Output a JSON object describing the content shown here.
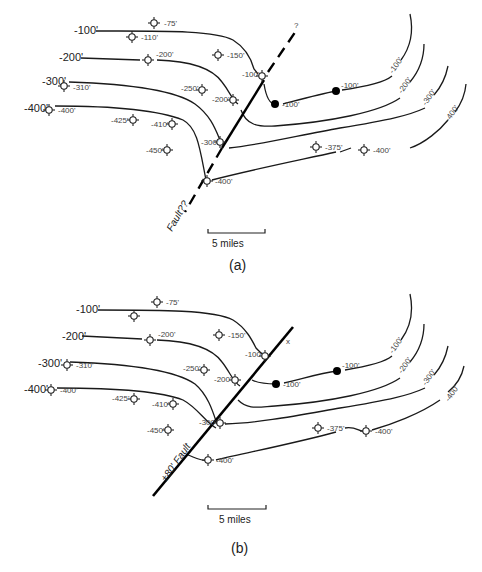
{
  "figure": {
    "panels": [
      {
        "id": "a",
        "caption": "(a)",
        "fault_label": "Fault??",
        "fault_end_marker": "?",
        "scale_label": "5 miles",
        "contour_labels_left": [
          "-100'",
          "-200'",
          "-300'",
          "-400'"
        ],
        "contour_labels_right": [
          "-100'",
          "-200'",
          "-300'",
          "-400'"
        ],
        "wells": [
          {
            "label": "-75'"
          },
          {
            "label": "-110'"
          },
          {
            "label": "-200'"
          },
          {
            "label": "-150'"
          },
          {
            "label": "-310'"
          },
          {
            "label": "-250'"
          },
          {
            "label": "-100'"
          },
          {
            "label": "-400'"
          },
          {
            "label": "-200'"
          },
          {
            "label": "-425'"
          },
          {
            "label": "-410'"
          },
          {
            "label": "-300'"
          },
          {
            "label": "-450'"
          },
          {
            "label": "-400'"
          },
          {
            "label": "-375'"
          },
          {
            "label": "-400'"
          }
        ],
        "dry_holes": [
          {
            "label": "-100'"
          },
          {
            "label": "-100'"
          }
        ]
      },
      {
        "id": "b",
        "caption": "(b)",
        "fault_label": "±80' Fault",
        "fault_end_marker": "x",
        "scale_label": "5 miles",
        "contour_labels_left": [
          "-100'",
          "-200'",
          "-300'",
          "-400'"
        ],
        "contour_labels_right": [
          "-100'",
          "-200'",
          "-300'",
          "-400'"
        ],
        "wells": [
          {
            "label": "-75'"
          },
          {
            "label": ""
          },
          {
            "label": "-200'"
          },
          {
            "label": "-150'"
          },
          {
            "label": "-310'"
          },
          {
            "label": "-250'"
          },
          {
            "label": "-100'"
          },
          {
            "label": "-400'"
          },
          {
            "label": "-200'"
          },
          {
            "label": "-425'"
          },
          {
            "label": "-410'"
          },
          {
            "label": "-300'"
          },
          {
            "label": "-450'"
          },
          {
            "label": "-400'"
          },
          {
            "label": "-375'"
          },
          {
            "label": "-400'"
          }
        ],
        "dry_holes": [
          {
            "label": "-100'"
          },
          {
            "label": "-100'"
          }
        ]
      }
    ]
  }
}
